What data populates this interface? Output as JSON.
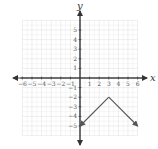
{
  "chart_data": {
    "type": "line",
    "title": "",
    "xlabel": "x",
    "ylabel": "y",
    "xlim": [
      -6,
      6
    ],
    "ylim": [
      -6,
      6
    ],
    "grid": true,
    "x_ticks": [
      -6,
      -5,
      -4,
      -3,
      -2,
      -1,
      1,
      2,
      3,
      4,
      5,
      6
    ],
    "y_ticks": [
      5,
      4,
      3,
      2,
      1,
      -1,
      -2,
      -3,
      -4,
      -5
    ],
    "series": [
      {
        "name": "piecewise linear (inverted V)",
        "x": [
          0,
          3,
          6
        ],
        "y": [
          -5,
          -2,
          -5
        ],
        "arrows_at_ends": true,
        "color": "#555555"
      }
    ]
  },
  "colors": {
    "grid": "#e2e2e2",
    "axis": "#333333",
    "line": "#555555"
  },
  "labels": {
    "x": "x",
    "y": "y"
  }
}
